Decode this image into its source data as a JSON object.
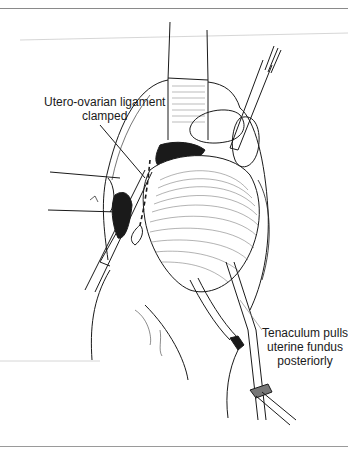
{
  "figure": {
    "labels": {
      "utero_ovarian": {
        "line1": "Utero-ovarian ligament",
        "line2": "clamped"
      },
      "tenaculum": {
        "line1": "Tenaculum pulls",
        "line2": "uterine fundus",
        "line3": "posteriorly"
      }
    },
    "colors": {
      "ink": "#1a1a1a",
      "rule": "#8a8a8a",
      "background": "#ffffff"
    }
  }
}
